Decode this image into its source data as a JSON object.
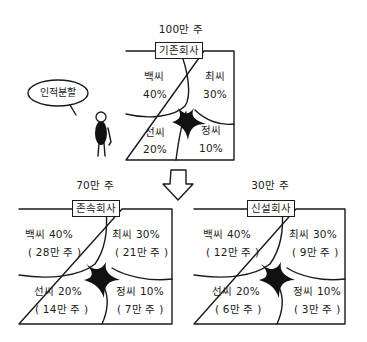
{
  "original": {
    "shares_caption": "100만 주",
    "company_label": "기존회사",
    "cells": [
      {
        "name": "백씨",
        "pct": "40%"
      },
      {
        "name": "최씨",
        "pct": "30%"
      },
      {
        "name": "선씨",
        "pct": "20%"
      },
      {
        "name": "정씨",
        "pct": "10%"
      }
    ]
  },
  "speech_bubble": "인적분할",
  "arrow": "down-arrow",
  "surviving": {
    "shares_caption": "70만 주",
    "company_label": "존속회사",
    "cells": [
      {
        "line1": "백씨 40%",
        "line2": "( 28만 주 )"
      },
      {
        "line1": "최씨 30%",
        "line2": "( 21만 주 )"
      },
      {
        "line1": "선씨 20%",
        "line2": "( 14만 주 )"
      },
      {
        "line1": "정씨 10%",
        "line2": "( 7만 주 )"
      }
    ]
  },
  "new_company": {
    "shares_caption": "30만 주",
    "company_label": "신설회사",
    "cells": [
      {
        "line1": "백씨 40%",
        "line2": "( 12만 주 )"
      },
      {
        "line1": "최씨 30%",
        "line2": "( 9만 주 )"
      },
      {
        "line1": "선씨 20%",
        "line2": "( 6만 주 )"
      },
      {
        "line1": "정씨 10%",
        "line2": "( 3만 주 )"
      }
    ]
  }
}
